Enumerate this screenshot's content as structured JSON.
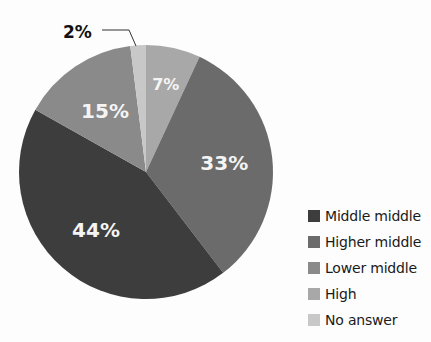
{
  "chart_data": {
    "type": "pie",
    "title": "",
    "categories": [
      "High",
      "Higher middle",
      "Middle middle",
      "Lower middle",
      "No answer"
    ],
    "values": [
      7,
      33,
      44,
      15,
      2
    ],
    "unit": "%",
    "slice_labels": [
      "7%",
      "33%",
      "44%",
      "15%",
      "2%"
    ],
    "colors": {
      "Middle middle": "#3d3d3d",
      "Higher middle": "#6b6b6b",
      "Lower middle": "#8a8a8a",
      "High": "#a8a8a8",
      "No answer": "#c8c8c8"
    },
    "legend": {
      "position": "right-bottom",
      "entries": [
        "Middle middle",
        "Higher middle",
        "Lower middle",
        "High",
        "No answer"
      ]
    },
    "annotations": [
      {
        "text": "2%",
        "target": "No answer",
        "style": "callout-line"
      }
    ]
  },
  "legend": {
    "items": [
      {
        "label": "Middle middle",
        "color": "#3d3d3d"
      },
      {
        "label": "Higher middle",
        "color": "#6b6b6b"
      },
      {
        "label": "Lower middle",
        "color": "#8a8a8a"
      },
      {
        "label": "High",
        "color": "#a8a8a8"
      },
      {
        "label": "No answer",
        "color": "#c8c8c8"
      }
    ]
  },
  "callout": {
    "label": "2%"
  }
}
